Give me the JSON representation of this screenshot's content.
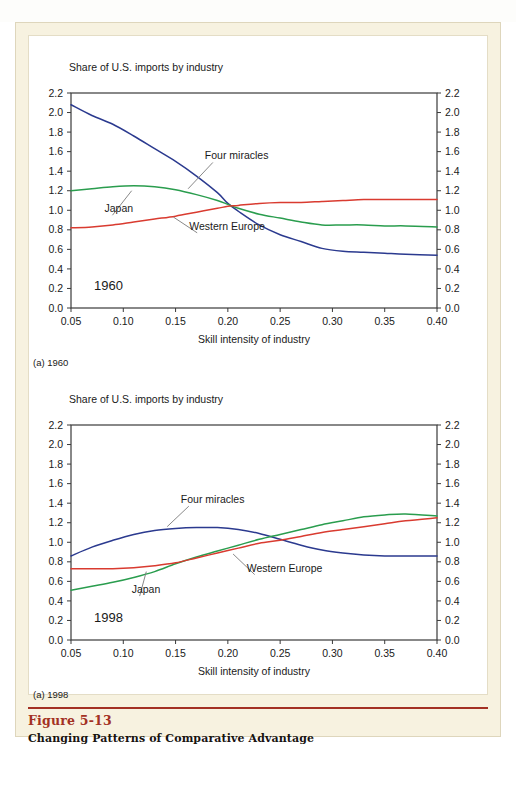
{
  "page": {
    "top_strip_text": "",
    "figure_number": "Figure 5-13",
    "figure_title": "Changing Patterns of Comparative Advantage",
    "accent_color": "#a33124",
    "paper_color": "#f7f2e0"
  },
  "colors": {
    "four_miracles": "#2b3a8f",
    "japan": "#2a9d4e",
    "western_europe": "#d93b30",
    "axis": "#3a3a3a",
    "text": "#1a1a1a"
  },
  "panels": [
    {
      "id": "panel-1960",
      "caption": "(a) 1960",
      "year_label": "1960",
      "headline": "Share of U.S. imports by industry",
      "xlabel": "Skill intensity of industry",
      "annotations": [
        {
          "name": "four-miracles",
          "text": "Four miracles",
          "x": 0.178,
          "y": 1.52,
          "leader_to_x": 0.162,
          "leader_to_y": 1.22
        },
        {
          "name": "japan",
          "text": "Japan",
          "x": 0.082,
          "y": 0.98,
          "leader_to_x": 0.108,
          "leader_to_y": 1.2
        },
        {
          "name": "western-europe",
          "text": "Western Europe",
          "x": 0.163,
          "y": 0.8,
          "leader_to_x": 0.148,
          "leader_to_y": 0.93
        }
      ],
      "chart_data": {
        "type": "line",
        "title": "Share of U.S. imports by industry",
        "xlabel": "Skill intensity of industry",
        "ylabel": "Share of U.S. imports by industry",
        "xlim": [
          0.05,
          0.4
        ],
        "ylim": [
          0.0,
          2.2
        ],
        "xticks": [
          "0.05",
          "0.10",
          "0.15",
          "0.20",
          "0.25",
          "0.30",
          "0.35",
          "0.40"
        ],
        "yticks": [
          "0.0",
          "0.2",
          "0.4",
          "0.6",
          "0.8",
          "1.0",
          "1.2",
          "1.4",
          "1.6",
          "1.8",
          "2.0",
          "2.2"
        ],
        "grid": false,
        "legend": "inline-annotations",
        "x": [
          0.05,
          0.07,
          0.09,
          0.11,
          0.13,
          0.15,
          0.17,
          0.19,
          0.2,
          0.21,
          0.23,
          0.25,
          0.27,
          0.29,
          0.31,
          0.33,
          0.35,
          0.37,
          0.4
        ],
        "series": [
          {
            "name": "Four miracles",
            "color": "#2b3a8f",
            "values": [
              2.08,
              1.97,
              1.88,
              1.76,
              1.63,
              1.5,
              1.35,
              1.18,
              1.07,
              0.99,
              0.85,
              0.75,
              0.68,
              0.61,
              0.58,
              0.57,
              0.56,
              0.55,
              0.54
            ]
          },
          {
            "name": "Japan",
            "color": "#2a9d4e",
            "values": [
              1.2,
              1.22,
              1.24,
              1.25,
              1.24,
              1.21,
              1.16,
              1.1,
              1.06,
              1.02,
              0.96,
              0.92,
              0.88,
              0.85,
              0.85,
              0.85,
              0.84,
              0.84,
              0.83
            ]
          },
          {
            "name": "Western Europe",
            "color": "#d93b30",
            "values": [
              0.82,
              0.83,
              0.85,
              0.88,
              0.91,
              0.94,
              0.98,
              1.02,
              1.04,
              1.05,
              1.07,
              1.08,
              1.08,
              1.09,
              1.1,
              1.11,
              1.11,
              1.11,
              1.11
            ]
          }
        ]
      }
    },
    {
      "id": "panel-1998",
      "caption": "(a) 1998",
      "year_label": "1998",
      "headline": "Share of U.S. imports by industry",
      "xlabel": "Skill intensity of industry",
      "annotations": [
        {
          "name": "four-miracles",
          "text": "Four miracles",
          "x": 0.155,
          "y": 1.4,
          "leader_to_x": 0.142,
          "leader_to_y": 1.16
        },
        {
          "name": "japan",
          "text": "Japan",
          "x": 0.108,
          "y": 0.48,
          "leader_to_x": 0.122,
          "leader_to_y": 0.7
        },
        {
          "name": "western-europe",
          "text": "Western Europe",
          "x": 0.218,
          "y": 0.7,
          "leader_to_x": 0.205,
          "leader_to_y": 0.88
        }
      ],
      "chart_data": {
        "type": "line",
        "title": "Share of U.S. imports by industry",
        "xlabel": "Skill intensity of industry",
        "ylabel": "Share of U.S. imports by industry",
        "xlim": [
          0.05,
          0.4
        ],
        "ylim": [
          0.0,
          2.2
        ],
        "xticks": [
          "0.05",
          "0.10",
          "0.15",
          "0.20",
          "0.25",
          "0.30",
          "0.35",
          "0.40"
        ],
        "yticks": [
          "0.0",
          "0.2",
          "0.4",
          "0.6",
          "0.8",
          "1.0",
          "1.2",
          "1.4",
          "1.6",
          "1.8",
          "2.0",
          "2.2"
        ],
        "grid": false,
        "legend": "inline-annotations",
        "x": [
          0.05,
          0.07,
          0.09,
          0.11,
          0.13,
          0.15,
          0.17,
          0.19,
          0.21,
          0.23,
          0.25,
          0.27,
          0.29,
          0.31,
          0.33,
          0.35,
          0.37,
          0.4
        ],
        "series": [
          {
            "name": "Four miracles",
            "color": "#2b3a8f",
            "values": [
              0.86,
              0.95,
              1.02,
              1.08,
              1.12,
              1.14,
              1.15,
              1.15,
              1.13,
              1.09,
              1.03,
              0.97,
              0.92,
              0.89,
              0.87,
              0.86,
              0.86,
              0.86
            ]
          },
          {
            "name": "Japan",
            "color": "#2a9d4e",
            "values": [
              0.51,
              0.55,
              0.59,
              0.64,
              0.7,
              0.78,
              0.85,
              0.91,
              0.97,
              1.03,
              1.08,
              1.13,
              1.18,
              1.22,
              1.26,
              1.28,
              1.29,
              1.27
            ]
          },
          {
            "name": "Western Europe",
            "color": "#d93b30",
            "values": [
              0.73,
              0.73,
              0.73,
              0.74,
              0.76,
              0.79,
              0.84,
              0.89,
              0.94,
              0.99,
              1.02,
              1.06,
              1.1,
              1.13,
              1.16,
              1.19,
              1.22,
              1.25
            ]
          }
        ]
      }
    }
  ]
}
